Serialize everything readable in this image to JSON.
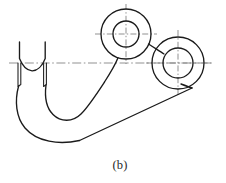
{
  "figure": {
    "caption": "(b)",
    "kind": "engineering-orthographic-view",
    "canvas": {
      "width": 226,
      "height": 183
    },
    "colors": {
      "background": "#ffffff",
      "outline": "#1b1b1b",
      "centerline": "#7d7d7d",
      "caption_text": "#2a2a2a"
    }
  },
  "geometry": {
    "upper_boss": {
      "name": "upper-boss",
      "center_x": 126,
      "center_y": 34,
      "outer_radius": 25,
      "bore_radius": 13,
      "centerline_h": {
        "x1": 95,
        "y1": 34,
        "x2": 157,
        "y2": 34
      },
      "centerline_v": {
        "x1": 126,
        "y1": 4,
        "x2": 126,
        "y2": 64
      }
    },
    "right_boss": {
      "name": "right-boss",
      "center_x": 178,
      "center_y": 63,
      "outer_radius": 26,
      "bore_radius": 15,
      "centerline_h": {
        "x1": 146,
        "y1": 63,
        "x2": 212,
        "y2": 63
      },
      "centerline_v": {
        "x1": 178,
        "y1": 30,
        "x2": 178,
        "y2": 97
      }
    },
    "main_centerline": {
      "x1": 9,
      "y1": 63,
      "x2": 212,
      "y2": 63
    },
    "notch": {
      "name": "left-u-notch",
      "left_wall_x": 19,
      "right_wall_x": 45,
      "top_y": 42,
      "arc_low_y": 58,
      "wall_bottom_y": 87
    },
    "hook": {
      "name": "hook-profile",
      "outer_sweep_bottom_y": 141,
      "inner_sweep_bottom_y": 123
    },
    "body": {
      "name": "lever-body",
      "long_edge_from": [
        82,
        140
      ],
      "long_edge_to": [
        193,
        89
      ]
    }
  },
  "paths": {
    "outer_profile": "M 19.5,42.0 L 19.5,58.5 C 22.5,66.0 27.5,70.5 32.0,70.8 C 37.2,71.0 42.3,66.2 45.2,58.4 L 45.2,42.0",
    "notch_left_wall_outer": "M 18.0,63.0 L 18.0,86.5 L 20.8,84.5 L 20.8,63.0",
    "notch_right_wall_outer": "M 43.6,63.0 L 43.6,86.5 L 46.4,84.5 L 46.4,63.0",
    "hook_outer": "M 18.6,86.0 C 14.5,101.0 16.0,117.5 25.0,128.0 C 37.0,142.0 59.0,145.0 79.5,140.5",
    "hook_inner": "M 46.0,85.0 C 44.5,97.0 46.5,108.0 53.0,114.5 C 60.5,122.0 72.5,122.5 81.0,114.0 C 88.5,106.5 96.0,95.0 104.5,82.0",
    "long_bottom_edge": "M 79.5,140.5 L 192.0,88.0",
    "web_to_upper_boss": "M 104.5,82.0 C 110.0,73.5 115.0,65.5 118.0,57.8",
    "upper_boss_tangent_right": "M 148.5,44.0 C 155.5,48.5 160.0,51.5 164.0,54.0",
    "right_boss_tangent_bottom": "M 192.0,88.0 C 189.0,87.0 185.0,85.5 181.0,84.0"
  },
  "caption_position": {
    "x": 120,
    "y": 168
  }
}
